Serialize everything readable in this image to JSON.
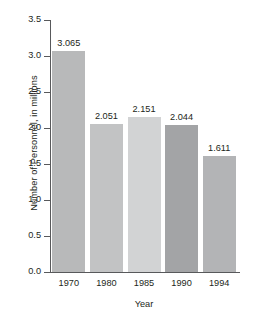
{
  "chart_data": {
    "type": "bar",
    "title": "",
    "xlabel": "Year",
    "ylabel": "Number of Personnel, in millions",
    "categories": [
      "1970",
      "1980",
      "1985",
      "1990",
      "1994"
    ],
    "values": [
      3.065,
      2.051,
      2.151,
      2.044,
      1.611
    ],
    "value_labels": [
      "3.065",
      "2.051",
      "2.151",
      "2.044",
      "1.611"
    ],
    "ylim": [
      0.0,
      3.5
    ],
    "ytick_labels": [
      "0.0",
      "0.5",
      "1.0",
      "1.5",
      "2.0",
      "2.5",
      "3.0",
      "3.5"
    ],
    "ytick_values": [
      0.0,
      0.5,
      1.0,
      1.5,
      2.0,
      2.5,
      3.0,
      3.5
    ],
    "grid": false,
    "legend": "none",
    "bar_colors": [
      "#b8b9ba",
      "#c2c3c4",
      "#d2d3d4",
      "#a3a4a6",
      "#b3b4b6"
    ],
    "axis_color": "#58595b",
    "text_color": "#231f20",
    "background": "#ffffff"
  }
}
